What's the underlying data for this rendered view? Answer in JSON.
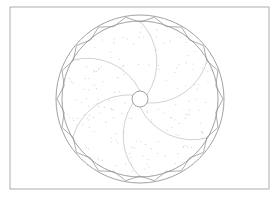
{
  "diagram": {
    "type": "technical-line-drawing",
    "frame": {
      "x": 10,
      "y": 7,
      "width": 259,
      "height": 182,
      "stroke": "#9a9a9a"
    },
    "center": {
      "x": 140,
      "y": 99
    },
    "outer_ring_radius": 84,
    "inner_ring_radius": 78,
    "hub_radius": 8,
    "blade_count": 6,
    "zigzag_segments": 36,
    "colors": {
      "background": "#ffffff",
      "frame": "#9a9a9a",
      "rings": "#8a8a8a",
      "zigzag": "#8a8a8a",
      "blades": "#bdbdbd",
      "hub": "#8a8a8a",
      "stipple": "#d2d2d2"
    }
  }
}
